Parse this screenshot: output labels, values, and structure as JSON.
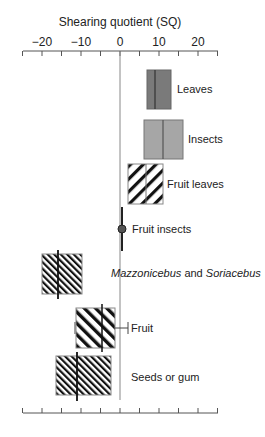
{
  "chart_data": {
    "type": "box",
    "title": "",
    "xlabel": "Shearing quotient (SQ)",
    "ylabel": "",
    "xlim": [
      -25,
      25
    ],
    "x_ticks_major": [
      -20,
      -10,
      0,
      10,
      20
    ],
    "x_tick_labels": [
      "−20",
      "−10",
      "0",
      "10",
      "20"
    ],
    "x_ticks_minor_step": 5,
    "axis_position": "top and bottom (bottom unlabeled)",
    "reference_line": 0,
    "grid": false,
    "legend": null,
    "categories": [
      "Leaves",
      "Insects",
      "Fruit leaves",
      "Fruit insects",
      "Mazzonicebus and Soriacebus",
      "Fruit",
      "Seeds or gum"
    ],
    "series": [
      {
        "name": "Leaves",
        "q1": 6.9,
        "median": 9.0,
        "q3": 13.1,
        "fill": "solid-dark-gray"
      },
      {
        "name": "Insects",
        "q1": 6.2,
        "median": 11.0,
        "q3": 16.2,
        "fill": "solid-light-gray"
      },
      {
        "name": "Fruit leaves",
        "q1": 2.1,
        "median": 6.7,
        "q3": 11.0,
        "fill": "wide-forward-hatch"
      },
      {
        "name": "Fruit insects",
        "value": 0.5,
        "fill": "point"
      },
      {
        "name": "Mazzonicebus and Soriacebus",
        "q1": -20.0,
        "median": -15.9,
        "q3": -9.7,
        "fill": "dense-back-hatch"
      },
      {
        "name": "Fruit",
        "q1": -11.3,
        "median": -4.6,
        "q3": -1.3,
        "whisker_low": -11.5,
        "whisker_high": 2.1,
        "fill": "medium-back-hatch"
      },
      {
        "name": "Seeds or gum",
        "q1": -16.4,
        "median": -11.0,
        "q3": -2.3,
        "fill": "dense-back-hatch"
      }
    ]
  },
  "labels": {
    "axis_title": "Shearing quotient (SQ)",
    "ticks": [
      "−20",
      "−10",
      "0",
      "10",
      "20"
    ],
    "leaves": "Leaves",
    "insects": "Insects",
    "fruit_leaves": "Fruit leaves",
    "fruit_insects": "Fruit insects",
    "mazz_a": "Mazzonicebus",
    "mazz_and": " and ",
    "mazz_b": "Soriacebus",
    "fruit": "Fruit",
    "seeds": "Seeds or gum"
  },
  "colors": {
    "leaves_fill": "#7a7a7a",
    "insects_fill": "#a6a6a6",
    "hatch": "#111111",
    "axis": "#555555",
    "zero_line": "#888888"
  }
}
